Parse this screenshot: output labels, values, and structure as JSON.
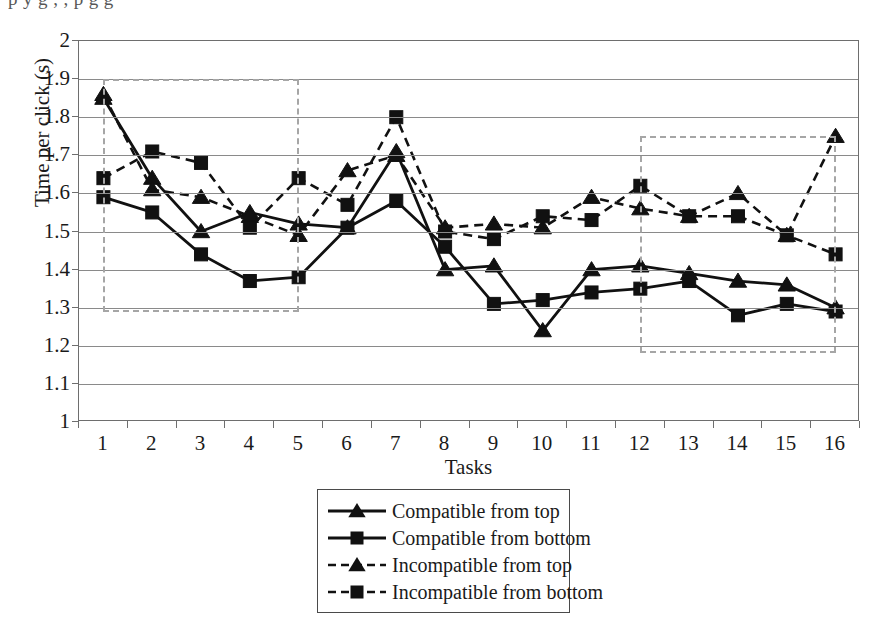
{
  "page": {
    "bleed_text": "p            y  g                                     ,          ,             p                g     g"
  },
  "figure": {
    "y_axis_title": "Time per click (s)",
    "x_axis_title": "Tasks"
  },
  "legend": {
    "items": [
      {
        "label": "Compatible from top",
        "marker": "triangle-marker",
        "line": "solid"
      },
      {
        "label": "Compatible from bottom",
        "marker": "square-marker",
        "line": "solid"
      },
      {
        "label": "Incompatible from top",
        "marker": "triangle-marker",
        "line": "dashed"
      },
      {
        "label": "Incompatible from bottom",
        "marker": "square-marker",
        "line": "dashed"
      }
    ]
  },
  "highlight_boxes": [
    {
      "name": "early-tasks-highlight",
      "x0": 1,
      "x1": 5,
      "y0": 1.29,
      "y1": 1.9,
      "color": "#a6a6a6"
    },
    {
      "name": "late-tasks-highlight",
      "x0": 12,
      "x1": 16,
      "y0": 1.18,
      "y1": 1.75,
      "color": "#a6a6a6"
    }
  ],
  "chart_data": {
    "type": "line",
    "title": "",
    "xlabel": "Tasks",
    "ylabel": "Time per click (s)",
    "xlim": [
      1,
      16
    ],
    "ylim": [
      1,
      2
    ],
    "ytick_step": 0.1,
    "grid": true,
    "legend_position": "bottom",
    "categories": [
      1,
      2,
      3,
      4,
      5,
      6,
      7,
      8,
      9,
      10,
      11,
      12,
      13,
      14,
      15,
      16
    ],
    "ytick_labels": [
      "1",
      "1.1",
      "1.2",
      "1.3",
      "1.4",
      "1.5",
      "1.6",
      "1.7",
      "1.8",
      "1.9",
      "2"
    ],
    "xtick_labels": [
      "1",
      "2",
      "3",
      "4",
      "5",
      "6",
      "7",
      "8",
      "9",
      "10",
      "11",
      "12",
      "13",
      "14",
      "15",
      "16"
    ],
    "series": [
      {
        "name": "Compatible from top",
        "line": "solid",
        "marker": "triangle",
        "color": "#111111",
        "values": [
          1.85,
          1.64,
          1.5,
          1.55,
          1.52,
          1.51,
          1.71,
          1.4,
          1.41,
          1.24,
          1.4,
          1.41,
          1.39,
          1.37,
          1.36,
          1.3
        ]
      },
      {
        "name": "Compatible from bottom",
        "line": "solid",
        "marker": "square",
        "color": "#111111",
        "values": [
          1.59,
          1.55,
          1.44,
          1.37,
          1.38,
          1.51,
          1.58,
          1.46,
          1.31,
          1.32,
          1.34,
          1.35,
          1.37,
          1.28,
          1.31,
          1.29
        ]
      },
      {
        "name": "Incompatible from top",
        "line": "dashed",
        "marker": "triangle",
        "color": "#111111",
        "values": [
          1.86,
          1.61,
          1.59,
          1.54,
          1.49,
          1.66,
          1.7,
          1.51,
          1.52,
          1.51,
          1.59,
          1.56,
          1.54,
          1.6,
          1.49,
          1.75
        ]
      },
      {
        "name": "Incompatible from bottom",
        "line": "dashed",
        "marker": "square",
        "color": "#111111",
        "values": [
          1.64,
          1.71,
          1.68,
          1.51,
          1.64,
          1.57,
          1.8,
          1.5,
          1.48,
          1.54,
          1.53,
          1.62,
          1.54,
          1.54,
          1.49,
          1.44
        ]
      }
    ]
  }
}
